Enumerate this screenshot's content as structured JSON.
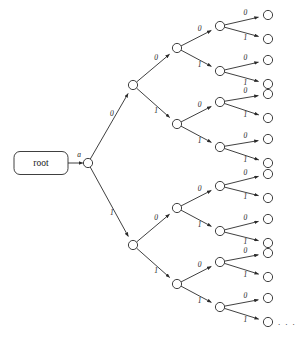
{
  "figure": {
    "name": "binary-prefix-tree",
    "background_color": "#ffffff",
    "stroke_color": "#2a2a2a",
    "text_color": "#1a1a1a"
  },
  "root": {
    "label": "root",
    "shape": "rounded-rectangle",
    "x": 41,
    "y": 163,
    "width": 54,
    "height": 23,
    "corner_radius": 6
  },
  "entry_edge": {
    "label": "a",
    "from_x": 68,
    "from_y": 163,
    "to_x": 88,
    "to_y": 163,
    "label_x": 79,
    "label_y": 157
  },
  "geometry": {
    "node_radius": 4.6,
    "arrow_gap": 5.2,
    "level_x": [
      88,
      133,
      177,
      220,
      268
    ],
    "level1_y": 163,
    "level2_y": [
      85,
      245
    ],
    "level3_y": [
      48,
      124,
      208,
      284
    ],
    "level4_y": [
      26,
      71,
      102,
      147,
      186,
      231,
      262,
      307
    ],
    "level5_y": [
      15,
      39,
      60,
      84,
      94,
      118,
      139,
      163,
      174,
      198,
      219,
      243,
      253,
      277,
      298,
      322
    ]
  },
  "edge_labels": {
    "zero": "0",
    "one": "1"
  },
  "branches": [
    {
      "from_level": 1,
      "from_index": 0,
      "to_index": 0,
      "label": "0"
    },
    {
      "from_level": 1,
      "from_index": 0,
      "to_index": 1,
      "label": "1"
    },
    {
      "from_level": 2,
      "from_index": 0,
      "to_index": 0,
      "label": "0"
    },
    {
      "from_level": 2,
      "from_index": 0,
      "to_index": 1,
      "label": "1"
    },
    {
      "from_level": 2,
      "from_index": 1,
      "to_index": 2,
      "label": "0"
    },
    {
      "from_level": 2,
      "from_index": 1,
      "to_index": 3,
      "label": "1"
    },
    {
      "from_level": 3,
      "from_index": 0,
      "to_index": 0,
      "label": "0"
    },
    {
      "from_level": 3,
      "from_index": 0,
      "to_index": 1,
      "label": "1"
    },
    {
      "from_level": 3,
      "from_index": 1,
      "to_index": 2,
      "label": "0"
    },
    {
      "from_level": 3,
      "from_index": 1,
      "to_index": 3,
      "label": "1"
    },
    {
      "from_level": 3,
      "from_index": 2,
      "to_index": 4,
      "label": "0"
    },
    {
      "from_level": 3,
      "from_index": 2,
      "to_index": 5,
      "label": "1"
    },
    {
      "from_level": 3,
      "from_index": 3,
      "to_index": 6,
      "label": "0"
    },
    {
      "from_level": 3,
      "from_index": 3,
      "to_index": 7,
      "label": "1"
    },
    {
      "from_level": 4,
      "from_index": 0,
      "to_index": 0,
      "label": "0"
    },
    {
      "from_level": 4,
      "from_index": 0,
      "to_index": 1,
      "label": "1"
    },
    {
      "from_level": 4,
      "from_index": 1,
      "to_index": 2,
      "label": "0"
    },
    {
      "from_level": 4,
      "from_index": 1,
      "to_index": 3,
      "label": "1"
    },
    {
      "from_level": 4,
      "from_index": 2,
      "to_index": 4,
      "label": "0"
    },
    {
      "from_level": 4,
      "from_index": 2,
      "to_index": 5,
      "label": "1"
    },
    {
      "from_level": 4,
      "from_index": 3,
      "to_index": 6,
      "label": "0"
    },
    {
      "from_level": 4,
      "from_index": 3,
      "to_index": 7,
      "label": "1"
    },
    {
      "from_level": 4,
      "from_index": 4,
      "to_index": 8,
      "label": "0"
    },
    {
      "from_level": 4,
      "from_index": 4,
      "to_index": 9,
      "label": "1"
    },
    {
      "from_level": 4,
      "from_index": 5,
      "to_index": 10,
      "label": "0"
    },
    {
      "from_level": 4,
      "from_index": 5,
      "to_index": 11,
      "label": "1"
    },
    {
      "from_level": 4,
      "from_index": 6,
      "to_index": 12,
      "label": "0"
    },
    {
      "from_level": 4,
      "from_index": 6,
      "to_index": 13,
      "label": "1"
    },
    {
      "from_level": 4,
      "from_index": 7,
      "to_index": 14,
      "label": "0"
    },
    {
      "from_level": 4,
      "from_index": 7,
      "to_index": 15,
      "label": "1"
    }
  ],
  "ellipsis": {
    "text": ". . .",
    "x": 278,
    "y": 325
  },
  "counts": {
    "level1_nodes": 1,
    "level2_nodes": 2,
    "level3_nodes": 4,
    "level4_nodes": 8,
    "level5_nodes": 16
  }
}
